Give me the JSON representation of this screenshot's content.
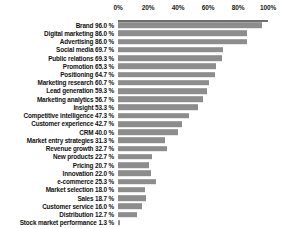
{
  "chart_data": {
    "type": "bar",
    "orientation": "horizontal",
    "title": "",
    "subtitle": "",
    "xlabel": "",
    "ylabel": "",
    "xlim": [
      0,
      100
    ],
    "grid": false,
    "legend": false,
    "value_suffix": " %",
    "bar_color": "#8d8d8d",
    "axis_color": "#6e6e6e",
    "text_color": "#111111",
    "axis_position": "top",
    "tick_labels": [
      "0%",
      "20%",
      "40%",
      "60%",
      "80%",
      "100%"
    ],
    "tick_values": [
      0,
      20,
      40,
      60,
      80,
      100
    ],
    "categories": [
      "Brand",
      "Digital marketing",
      "Advertising",
      "Social media",
      "Public relations",
      "Promotion",
      "Positioning",
      "Marketing research",
      "Lead generation",
      "Marketing analytics",
      "Insight",
      "Competitive intelligence",
      "Customer experience",
      "CRM",
      "Market entry strategies",
      "Revenue growth",
      "New products",
      "Pricing",
      "Innovation",
      "e-commerce",
      "Market selection",
      "Sales",
      "Customer service",
      "Distribution",
      "Stock market performance"
    ],
    "values": [
      96.0,
      86.0,
      86.0,
      69.7,
      69.3,
      65.3,
      64.7,
      60.7,
      59.3,
      56.7,
      53.3,
      47.3,
      42.7,
      40.0,
      31.3,
      32.7,
      22.7,
      20.7,
      22.0,
      25.3,
      18.0,
      18.7,
      16.0,
      12.7,
      1.3
    ],
    "row_labels": [
      "Brand 96.0 %",
      "Digital marketing 86.0 %",
      "Advertising 86.0 %",
      "Social media 69.7 %",
      "Public relations 69.3 %",
      "Promotion 65.3 %",
      "Positioning 64.7 %",
      "Marketing research 60.7 %",
      "Lead generation 59.3 %",
      "Marketing analytics 56.7 %",
      "Insight 53.3 %",
      "Competitive intelligence 47.3 %",
      "Customer experience 42.7 %",
      "CRM 40.0 %",
      "Market entry strategies 31.3 %",
      "Revenue growth 32.7 %",
      "New products 22.7 %",
      "Pricing 20.7 %",
      "Innovation 22.0 %",
      "e-commerce 25.3 %",
      "Market selection 18.0 %",
      "Sales 18.7 %",
      "Customer service 16.0 %",
      "Distribution 12.7 %",
      "Stock market performance 1.3 %"
    ]
  }
}
